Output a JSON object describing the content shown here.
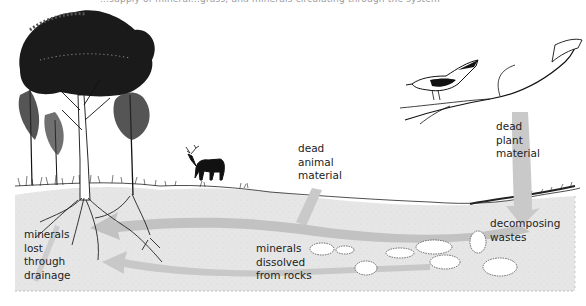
{
  "caption": {
    "partial_text": "...supply of mineral...grass, and minerals circulating through the system"
  },
  "labels": {
    "dead_animal": [
      "dead",
      "animal",
      "material"
    ],
    "dead_plant": [
      "dead",
      "plant",
      "material"
    ],
    "decomposing": [
      "decomposing",
      "wastes"
    ],
    "drainage": [
      "minerals",
      "lost",
      "through",
      "drainage"
    ],
    "rocks": [
      "minerals",
      "dissolved",
      "from rocks"
    ]
  },
  "figures": {
    "trees": "trees-with-roots",
    "deer": "deer-silhouette",
    "bird": "bird-on-branch",
    "rocks": "rocks-in-soil"
  },
  "colors": {
    "soil": "#e4e4e4",
    "arrow": "#c4c4c4",
    "ink": "#111111",
    "text": "#222222"
  }
}
